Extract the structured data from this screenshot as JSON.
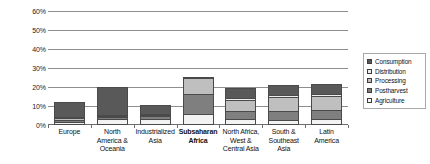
{
  "chart_data": {
    "type": "bar",
    "stacked": true,
    "title": "",
    "subtitle": "",
    "xlabel": "",
    "ylabel": "",
    "ylim": [
      0,
      60
    ],
    "ytick_labels": [
      "0%",
      "10%",
      "20%",
      "30%",
      "40%",
      "50%",
      "60%"
    ],
    "ytick_values": [
      0,
      10,
      20,
      30,
      40,
      50,
      60
    ],
    "grid": true,
    "legend_position": "right",
    "categories": [
      "Europe",
      "North America & Oceania",
      "Industrialized Asia",
      "Subsaharan Africa",
      "North Africa, West & Central Asia",
      "South & Southeast Asia",
      "Latin America"
    ],
    "category_lines": [
      [
        "Europe"
      ],
      [
        "North",
        "America &",
        "Oceania"
      ],
      [
        "Industrialized",
        "Asia"
      ],
      [
        "Subsaharan",
        "Africa"
      ],
      [
        "North Africa,",
        "West &",
        "Central Asia"
      ],
      [
        "South &",
        "Southeast",
        "Asia"
      ],
      [
        "Latin",
        "America"
      ]
    ],
    "emphasized_category": "Subsaharan Africa",
    "series": [
      {
        "name": "Agriculture",
        "color": "#f2f2f2",
        "values": [
          1.7,
          3.4,
          3.1,
          5.6,
          3.2,
          2.8,
          3.4
        ]
      },
      {
        "name": "Postharvest",
        "color": "#7f7f7f",
        "values": [
          1.2,
          0.8,
          1.6,
          10.6,
          4.0,
          4.6,
          4.6
        ]
      },
      {
        "name": "Processing",
        "color": "#bfbfbf",
        "values": [
          0.9,
          0.5,
          0.6,
          8.8,
          6.2,
          7.4,
          7.4
        ]
      },
      {
        "name": "Distribution",
        "color": "#ededed",
        "values": [
          0.6,
          0.4,
          0.4,
          0.4,
          1.0,
          1.2,
          1.1
        ]
      },
      {
        "name": "Consumption",
        "color": "#595959",
        "values": [
          7.9,
          14.9,
          4.8,
          0.0,
          5.2,
          5.2,
          5.2
        ]
      }
    ],
    "totals": [
      12.3,
      20.0,
      10.5,
      25.4,
      19.6,
      21.2,
      21.7
    ],
    "legend_order": [
      "Consumption",
      "Distribution",
      "Processing",
      "Postharvest",
      "Agriculture"
    ]
  }
}
